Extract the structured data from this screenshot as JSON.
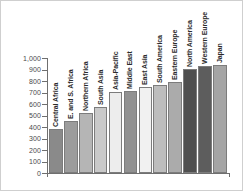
{
  "chart_data": {
    "type": "bar",
    "title": "",
    "xlabel": "",
    "ylabel": "",
    "ylim": [
      0,
      1000
    ],
    "grid": false,
    "legend": "none",
    "y_ticks": [
      "1,000",
      "900",
      "800",
      "700",
      "600",
      "500",
      "400",
      "300",
      "200",
      "100",
      "0"
    ],
    "y_tick_values": [
      1000,
      900,
      800,
      700,
      600,
      500,
      400,
      300,
      200,
      100,
      0
    ],
    "categories": [
      "Central Africa",
      "E. and S. Africa",
      "Northern Africa",
      "South Asia",
      "Asia-Pacific",
      "Middle East",
      "East Asia",
      "South America",
      "Eastern Europe",
      "North America",
      "Western Europe",
      "Japan"
    ],
    "values": [
      380,
      455,
      520,
      575,
      705,
      712,
      750,
      768,
      795,
      905,
      928,
      938
    ],
    "bar_colors": [
      "#8a8a8a",
      "#9c9c9c",
      "#b5b5b5",
      "#c9c9c9",
      "#ededed",
      "#919191",
      "#f1f1f1",
      "#bdbdbd",
      "#ababab",
      "#4f4f4f",
      "#5d5d5d",
      "#a5a5a5"
    ],
    "bar_border_color": "#7c7c7c",
    "axis_color": "#6f6f6f",
    "tick_label_color": "#4a4a4a",
    "category_label_color": "#2b2b2b",
    "background": "#ffffff",
    "frame_color": "#cfcfcf"
  }
}
